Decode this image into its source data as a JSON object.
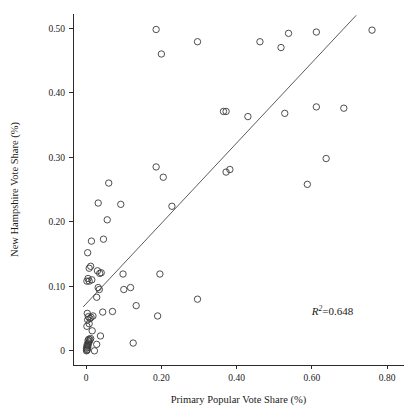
{
  "chart_data": {
    "type": "scatter",
    "title": "",
    "xlabel": "Primary Popular Vote Share (%)",
    "ylabel": "New Hampshire Vote Share (%)",
    "xlim": [
      -0.035,
      0.845
    ],
    "ylim": [
      -0.022,
      0.522
    ],
    "grid": false,
    "legend": null,
    "xticks": [
      0,
      0.2,
      0.4,
      0.6,
      0.8
    ],
    "xticklabels": [
      "0",
      "0.20",
      "0.40",
      "0.60",
      "0.80"
    ],
    "yticks": [
      0,
      0.1,
      0.2,
      0.3,
      0.4,
      0.5
    ],
    "yticklabels": [
      "0",
      "0.10",
      "0.20",
      "0.30",
      "0.40",
      "0.50"
    ],
    "annotations": [
      {
        "name": "r-squared",
        "text": "R2=0.648",
        "symbol": "R",
        "superscript": "2",
        "equals": "=",
        "value": "0.648",
        "x": 0.6,
        "y": 0.055
      }
    ],
    "trendline": {
      "type": "linear-fit",
      "x_start": -0.008,
      "y_start": 0.068,
      "x_end": 0.718,
      "y_end": 0.52,
      "r_squared": 0.648
    },
    "marker": {
      "shape": "circle-open",
      "radius_px": 3.2,
      "edge_color": "#3a3a3a",
      "fill_color": "none"
    },
    "points": [
      [
        0.001,
        0.0
      ],
      [
        0.002,
        0.001
      ],
      [
        0.003,
        0.002
      ],
      [
        0.001,
        0.004
      ],
      [
        0.004,
        0.005
      ],
      [
        0.002,
        0.007
      ],
      [
        0.005,
        0.008
      ],
      [
        0.003,
        0.01
      ],
      [
        0.006,
        0.012
      ],
      [
        0.008,
        0.014
      ],
      [
        0.005,
        0.016
      ],
      [
        0.01,
        0.017
      ],
      [
        0.007,
        0.018
      ],
      [
        0.012,
        0.019
      ],
      [
        0.022,
        0.0
      ],
      [
        0.028,
        0.01
      ],
      [
        0.016,
        0.031
      ],
      [
        0.038,
        0.023
      ],
      [
        0.002,
        0.038
      ],
      [
        0.008,
        0.042
      ],
      [
        0.004,
        0.048
      ],
      [
        0.01,
        0.05
      ],
      [
        0.013,
        0.052
      ],
      [
        0.006,
        0.053
      ],
      [
        0.018,
        0.054
      ],
      [
        0.003,
        0.058
      ],
      [
        0.044,
        0.06
      ],
      [
        0.07,
        0.061
      ],
      [
        0.125,
        0.012
      ],
      [
        0.133,
        0.07
      ],
      [
        0.19,
        0.054
      ],
      [
        0.1,
        0.095
      ],
      [
        0.118,
        0.098
      ],
      [
        0.028,
        0.083
      ],
      [
        0.035,
        0.095
      ],
      [
        0.032,
        0.098
      ],
      [
        0.002,
        0.108
      ],
      [
        0.008,
        0.108
      ],
      [
        0.015,
        0.11
      ],
      [
        0.005,
        0.112
      ],
      [
        0.036,
        0.12
      ],
      [
        0.04,
        0.121
      ],
      [
        0.03,
        0.124
      ],
      [
        0.098,
        0.119
      ],
      [
        0.196,
        0.119
      ],
      [
        0.296,
        0.08
      ],
      [
        0.008,
        0.128
      ],
      [
        0.012,
        0.131
      ],
      [
        0.004,
        0.152
      ],
      [
        0.014,
        0.17
      ],
      [
        0.046,
        0.173
      ],
      [
        0.056,
        0.203
      ],
      [
        0.032,
        0.229
      ],
      [
        0.092,
        0.227
      ],
      [
        0.06,
        0.26
      ],
      [
        0.228,
        0.224
      ],
      [
        0.186,
        0.285
      ],
      [
        0.205,
        0.269
      ],
      [
        0.372,
        0.277
      ],
      [
        0.382,
        0.281
      ],
      [
        0.588,
        0.258
      ],
      [
        0.638,
        0.298
      ],
      [
        0.365,
        0.371
      ],
      [
        0.372,
        0.371
      ],
      [
        0.43,
        0.363
      ],
      [
        0.528,
        0.368
      ],
      [
        0.612,
        0.378
      ],
      [
        0.685,
        0.376
      ],
      [
        0.186,
        0.498
      ],
      [
        0.2,
        0.46
      ],
      [
        0.296,
        0.479
      ],
      [
        0.462,
        0.479
      ],
      [
        0.518,
        0.47
      ],
      [
        0.538,
        0.492
      ],
      [
        0.612,
        0.494
      ],
      [
        0.76,
        0.497
      ]
    ]
  }
}
